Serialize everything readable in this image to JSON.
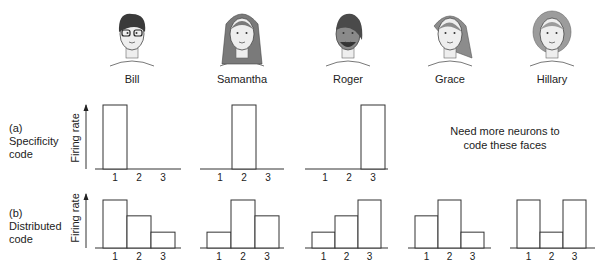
{
  "faces": [
    {
      "name": "Bill",
      "cx": 132,
      "hair": "#3a3a3a",
      "hairStyle": "short",
      "glasses": true
    },
    {
      "name": "Samantha",
      "cx": 242,
      "hair": "#7a7a7a",
      "hairStyle": "long",
      "glasses": false
    },
    {
      "name": "Roger",
      "cx": 348,
      "hair": "#4a4a4a",
      "hairStyle": "cap",
      "glasses": false,
      "skin": "#8a8a8a"
    },
    {
      "name": "Grace",
      "cx": 450,
      "hair": "#8c8c8c",
      "hairStyle": "side",
      "glasses": false
    },
    {
      "name": "Hillary",
      "cx": 552,
      "hair": "#9c9c9c",
      "hairStyle": "curly",
      "glasses": false
    }
  ],
  "rows": [
    {
      "id": "a",
      "label_line1": "(a)",
      "label_line2": "Specificity",
      "label_line3": "code",
      "ylabel": "Firing rate"
    },
    {
      "id": "b",
      "label_line1": "(b)",
      "label_line2": "Distributed",
      "label_line3": "code",
      "ylabel": "Firing rate"
    }
  ],
  "note": {
    "line1": "Need more neurons to",
    "line2": "code these faces"
  },
  "tick_labels": [
    "1",
    "2",
    "3"
  ],
  "chart_data": [
    {
      "type": "bar",
      "title": "Specificity code - Bill",
      "categories": [
        "1",
        "2",
        "3"
      ],
      "values": [
        1.0,
        0,
        0
      ],
      "ylabel": "Firing rate",
      "xlabel": "Neuron"
    },
    {
      "type": "bar",
      "title": "Specificity code - Samantha",
      "categories": [
        "1",
        "2",
        "3"
      ],
      "values": [
        0,
        1.0,
        0
      ],
      "ylabel": "Firing rate",
      "xlabel": "Neuron"
    },
    {
      "type": "bar",
      "title": "Specificity code - Roger",
      "categories": [
        "1",
        "2",
        "3"
      ],
      "values": [
        0,
        0,
        1.0
      ],
      "ylabel": "Firing rate",
      "xlabel": "Neuron"
    },
    {
      "type": "bar",
      "title": "Distributed code - Bill",
      "categories": [
        "1",
        "2",
        "3"
      ],
      "values": [
        1.0,
        0.67,
        0.33
      ],
      "ylabel": "Firing rate",
      "xlabel": "Neuron"
    },
    {
      "type": "bar",
      "title": "Distributed code - Samantha",
      "categories": [
        "1",
        "2",
        "3"
      ],
      "values": [
        0.33,
        1.0,
        0.67
      ],
      "ylabel": "Firing rate",
      "xlabel": "Neuron"
    },
    {
      "type": "bar",
      "title": "Distributed code - Roger",
      "categories": [
        "1",
        "2",
        "3"
      ],
      "values": [
        0.33,
        0.67,
        1.0
      ],
      "ylabel": "Firing rate",
      "xlabel": "Neuron"
    },
    {
      "type": "bar",
      "title": "Distributed code - Grace",
      "categories": [
        "1",
        "2",
        "3"
      ],
      "values": [
        0.67,
        1.0,
        0.33
      ],
      "ylabel": "Firing rate",
      "xlabel": "Neuron"
    },
    {
      "type": "bar",
      "title": "Distributed code - Hillary",
      "categories": [
        "1",
        "2",
        "3"
      ],
      "values": [
        1.0,
        0.33,
        1.0
      ],
      "ylabel": "Firing rate",
      "xlabel": "Neuron"
    }
  ],
  "layout": {
    "rowA": {
      "baseline": 169,
      "top": 105
    },
    "rowB": {
      "baseline": 248,
      "top": 200
    },
    "charts_a": [
      {
        "axisX0": 95,
        "axisX1": 181,
        "barX": 103,
        "barW": 24,
        "arrowX": 86
      },
      {
        "axisX0": 200,
        "axisX1": 284,
        "barX": 208,
        "barW": 24
      },
      {
        "axisX0": 305,
        "axisX1": 388,
        "barX": 313,
        "barW": 24
      }
    ],
    "charts_b": [
      {
        "axisX0": 95,
        "axisX1": 181,
        "barX": 103,
        "barW": 24,
        "arrowX": 86
      },
      {
        "axisX0": 200,
        "axisX1": 284,
        "barX": 207,
        "barW": 24
      },
      {
        "axisX0": 305,
        "axisX1": 388,
        "barX": 312,
        "barW": 23
      },
      {
        "axisX0": 408,
        "axisX1": 491,
        "barX": 415,
        "barW": 23
      },
      {
        "axisX0": 510,
        "axisX1": 595,
        "barX": 517,
        "barW": 23
      }
    ]
  }
}
